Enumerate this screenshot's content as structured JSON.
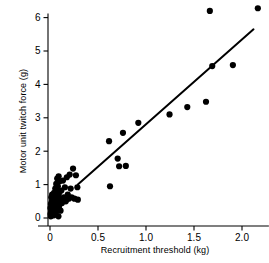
{
  "chart_data": {
    "type": "scatter",
    "title": "",
    "xlabel": "Recruitment threshold (kg)",
    "ylabel": "Motor unit twitch force (g)",
    "xlim": [
      -0.12,
      2.28
    ],
    "ylim": [
      -0.22,
      6.45
    ],
    "xticks": [
      0,
      0.5,
      1.0,
      1.5,
      2.0
    ],
    "xticklabels": [
      "0",
      "0.5",
      "1.0",
      "1.5",
      "2.0"
    ],
    "yticks": [
      0,
      1,
      2,
      3,
      4,
      5,
      6
    ],
    "yticklabels": [
      "0",
      "1",
      "2",
      "3",
      "4",
      "5",
      "6"
    ],
    "grid": false,
    "legend": null,
    "marker_color": "#000000",
    "marker_size": 3.1,
    "line_color": "#000000",
    "line_width": 2.0,
    "points": [
      [
        0.005,
        0.12
      ],
      [
        0.005,
        0.3
      ],
      [
        0.008,
        0.05
      ],
      [
        0.01,
        0.42
      ],
      [
        0.012,
        0.2
      ],
      [
        0.014,
        0.62
      ],
      [
        0.015,
        0.33
      ],
      [
        0.018,
        0.08
      ],
      [
        0.02,
        0.5
      ],
      [
        0.02,
        0.25
      ],
      [
        0.022,
        0.7
      ],
      [
        0.025,
        0.15
      ],
      [
        0.026,
        0.38
      ],
      [
        0.028,
        0.55
      ],
      [
        0.03,
        0.1
      ],
      [
        0.03,
        0.28
      ],
      [
        0.032,
        0.45
      ],
      [
        0.034,
        0.66
      ],
      [
        0.036,
        0.22
      ],
      [
        0.038,
        0.35
      ],
      [
        0.04,
        0.52
      ],
      [
        0.04,
        0.08
      ],
      [
        0.042,
        0.75
      ],
      [
        0.045,
        0.3
      ],
      [
        0.046,
        0.18
      ],
      [
        0.048,
        0.6
      ],
      [
        0.05,
        0.4
      ],
      [
        0.052,
        0.25
      ],
      [
        0.055,
        0.88
      ],
      [
        0.056,
        0.12
      ],
      [
        0.058,
        0.48
      ],
      [
        0.06,
        0.68
      ],
      [
        0.062,
        0.32
      ],
      [
        0.065,
        1.02
      ],
      [
        0.066,
        0.55
      ],
      [
        0.068,
        0.2
      ],
      [
        0.07,
        0.8
      ],
      [
        0.072,
        0.42
      ],
      [
        0.075,
        1.18
      ],
      [
        0.078,
        0.62
      ],
      [
        0.08,
        0.28
      ],
      [
        0.082,
        0.95
      ],
      [
        0.085,
        0.5
      ],
      [
        0.088,
        0.05
      ],
      [
        0.09,
        1.25
      ],
      [
        0.092,
        0.72
      ],
      [
        0.095,
        0.35
      ],
      [
        0.1,
        1.1
      ],
      [
        0.105,
        0.58
      ],
      [
        0.11,
        0.22
      ],
      [
        0.118,
        0.82
      ],
      [
        0.125,
        0.45
      ],
      [
        0.135,
        1.12
      ],
      [
        0.145,
        0.62
      ],
      [
        0.155,
        0.92
      ],
      [
        0.165,
        0.5
      ],
      [
        0.175,
        1.22
      ],
      [
        0.185,
        0.7
      ],
      [
        0.195,
        0.58
      ],
      [
        0.205,
        1.3
      ],
      [
        0.215,
        0.88
      ],
      [
        0.225,
        0.62
      ],
      [
        0.24,
        1.48
      ],
      [
        0.255,
        0.58
      ],
      [
        0.27,
        1.28
      ],
      [
        0.285,
        0.92
      ],
      [
        0.29,
        0.55
      ],
      [
        0.615,
        2.3
      ],
      [
        0.625,
        0.95
      ],
      [
        0.705,
        1.78
      ],
      [
        0.72,
        1.55
      ],
      [
        0.76,
        2.55
      ],
      [
        0.79,
        1.56
      ],
      [
        0.92,
        2.85
      ],
      [
        1.245,
        3.1
      ],
      [
        1.43,
        3.32
      ],
      [
        1.625,
        3.48
      ],
      [
        1.665,
        6.2
      ],
      [
        1.69,
        4.55
      ],
      [
        1.905,
        4.58
      ],
      [
        2.165,
        6.28
      ]
    ],
    "fit_line": {
      "x_start": 0.29,
      "y_start": 1.0,
      "x_end": 2.12,
      "y_end": 5.65
    }
  }
}
